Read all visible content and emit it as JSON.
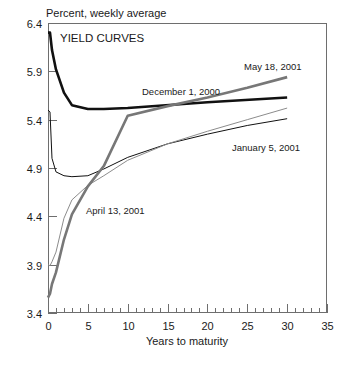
{
  "chart_data": {
    "type": "line",
    "title": "YIELD CURVES",
    "units_label": "Percent, weekly average",
    "xlabel": "Years to maturity",
    "ylabel": "",
    "xlim": [
      0,
      35
    ],
    "ylim": [
      3.4,
      6.4
    ],
    "xticks": [
      0,
      5,
      10,
      15,
      20,
      25,
      30,
      35
    ],
    "xtick_labels": [
      "0",
      "5",
      "10",
      "15",
      "20",
      "25",
      "30",
      "35"
    ],
    "yticks": [
      3.4,
      3.9,
      4.4,
      4.9,
      5.4,
      5.9,
      6.4
    ],
    "ytick_labels": [
      "3.4",
      "3.9",
      "4.4",
      "4.9",
      "5.4",
      "5.9",
      "6.4"
    ],
    "minor_xtick_interval": 1,
    "grid": false,
    "legend": "inline annotations",
    "series": [
      {
        "name": "December 1, 2000",
        "color": "#111111",
        "width": 2.6,
        "label_x": 142,
        "label_y": 95,
        "x": [
          0,
          0.25,
          0.5,
          1,
          2,
          3,
          5,
          7,
          10,
          20,
          30
        ],
        "y": [
          6.3,
          6.3,
          6.12,
          5.92,
          5.68,
          5.55,
          5.51,
          5.51,
          5.52,
          5.58,
          5.63
        ]
      },
      {
        "name": "January 5, 2001",
        "color": "#111111",
        "width": 1.0,
        "label_x": 232,
        "label_y": 151,
        "x": [
          0,
          0.25,
          0.5,
          1,
          2,
          3,
          5,
          7,
          10,
          15,
          20,
          25,
          30
        ],
        "y": [
          5.5,
          5.48,
          5.0,
          4.86,
          4.82,
          4.81,
          4.82,
          4.89,
          5.01,
          5.15,
          5.25,
          5.34,
          5.41
        ]
      },
      {
        "name": "April 13, 2001",
        "color": "#8c8c8c",
        "width": 1.0,
        "label_x": 86,
        "label_y": 214,
        "x": [
          0,
          0.25,
          0.5,
          1,
          2,
          3,
          5,
          7,
          10,
          15,
          20,
          25,
          30
        ],
        "y": [
          3.9,
          3.89,
          3.93,
          4.03,
          4.38,
          4.57,
          4.72,
          4.82,
          4.98,
          5.15,
          5.28,
          5.4,
          5.52
        ]
      },
      {
        "name": "May 18, 2001",
        "color": "#777777",
        "width": 2.6,
        "label_x": 244,
        "label_y": 70,
        "x": [
          0,
          0.25,
          0.5,
          1,
          2,
          3,
          5,
          7,
          10,
          15,
          20,
          25,
          30
        ],
        "y": [
          3.56,
          3.6,
          3.7,
          3.82,
          4.16,
          4.42,
          4.71,
          4.92,
          5.44,
          5.54,
          5.63,
          5.73,
          5.84
        ]
      }
    ]
  },
  "plot_geometry": {
    "left": 48,
    "right": 327,
    "top": 23,
    "bottom": 313
  }
}
